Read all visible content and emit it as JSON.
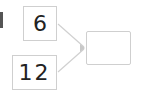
{
  "diagram": {
    "inputs": [
      {
        "label": "6"
      },
      {
        "label": "12"
      }
    ],
    "output": {
      "label": ""
    },
    "colors": {
      "border": "#cfcfcf",
      "arrow": "#d0d0d0",
      "text": "#222222"
    }
  }
}
